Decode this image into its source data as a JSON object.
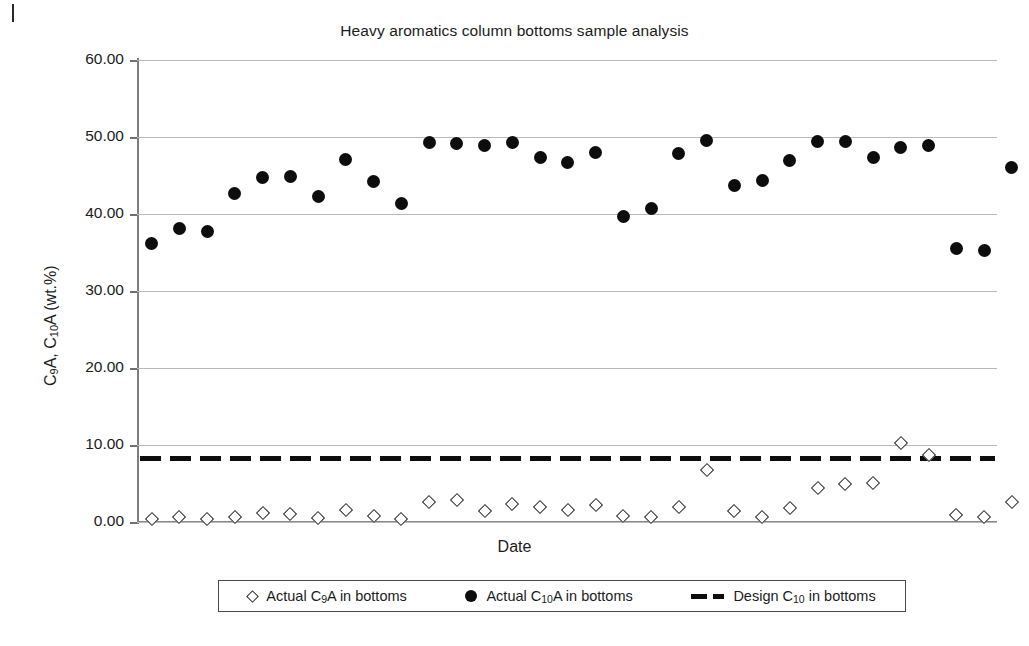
{
  "chart_data": {
    "type": "scatter",
    "title": "Heavy aromatics column bottoms sample analysis",
    "xlabel": "Date",
    "ylabel_html": "C<sub>9</sub>A, C<sub>10</sub>A (wt.%)",
    "ylabel_text": "C9A, C10A (wt.%)",
    "ylim": [
      0,
      60
    ],
    "ytick_labels": [
      "60.00",
      "50.00",
      "40.00",
      "30.00",
      "20.00",
      "10.00",
      "0.00"
    ],
    "ytick_values": [
      60,
      50,
      40,
      30,
      20,
      10,
      0
    ],
    "grid": "horizontal",
    "legend_position": "bottom-outside",
    "x_count": 30,
    "x": [
      1,
      2,
      3,
      4,
      5,
      6,
      7,
      8,
      9,
      10,
      11,
      12,
      13,
      14,
      15,
      16,
      17,
      18,
      19,
      20,
      21,
      22,
      23,
      24,
      25,
      26,
      27,
      28,
      29,
      30
    ],
    "series": [
      {
        "name": "Actual C9A in bottoms",
        "name_html": "Actual C<sub>9</sub>A in bottoms",
        "marker": "open-diamond",
        "color": "#2b2b2b",
        "values": [
          0.4,
          0.6,
          0.4,
          0.7,
          1.2,
          1.1,
          0.5,
          1.5,
          0.8,
          0.4,
          2.6,
          2.8,
          1.4,
          2.3,
          2.0,
          1.6,
          2.2,
          0.8,
          0.6,
          2.0,
          6.8,
          1.4,
          0.7,
          1.8,
          4.4,
          5.0,
          5.1,
          10.3,
          8.7,
          0.9
        ]
      },
      {
        "name": "Actual C10A in bottoms",
        "name_html": "Actual C<sub>10</sub>A in bottoms",
        "marker": "filled-circle",
        "color": "#0d0d0d",
        "values": [
          36.2,
          38.1,
          37.7,
          42.6,
          44.7,
          44.9,
          42.3,
          47.1,
          44.2,
          41.3,
          49.3,
          49.2,
          48.9,
          49.3,
          47.4,
          46.7,
          48.0,
          39.7,
          40.7,
          47.9,
          49.6,
          43.7,
          44.4,
          46.9,
          49.4,
          49.4,
          47.3,
          48.6,
          48.9,
          35.5
        ]
      },
      {
        "name": "Design C10 in bottoms",
        "name_html": "Design C<sub>10</sub> in bottoms",
        "marker": "thick-dashed-line",
        "color": "#0d0d0d",
        "constant_value": 8.2
      }
    ],
    "extra_c9a_tail": [
      0.7,
      2.6
    ],
    "extra_c10a_tail": [
      35.2,
      46.1
    ]
  },
  "legend": {
    "items": [
      {
        "label_html": "Actual C<sub>9</sub>A in bottoms",
        "marker": "open-diamond"
      },
      {
        "label_html": "Actual C<sub>10</sub>A in bottoms",
        "marker": "filled-circle"
      },
      {
        "label_html": "Design C<sub>10</sub> in bottoms",
        "marker": "thick-dashed-line"
      }
    ]
  }
}
